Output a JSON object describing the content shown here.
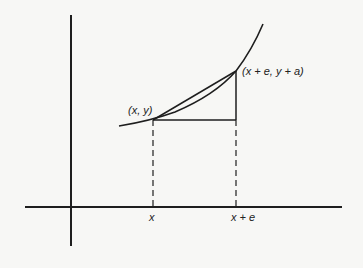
{
  "diagram": {
    "type": "calculus secant/difference quotient illustration",
    "labels": {
      "point_start": "(x, y)",
      "point_end": "(x + e, y + a)",
      "tick_x": "x",
      "tick_xe": "x + e"
    },
    "colors": {
      "background": "#f7f7f5",
      "stroke": "#1e1e1e"
    }
  }
}
